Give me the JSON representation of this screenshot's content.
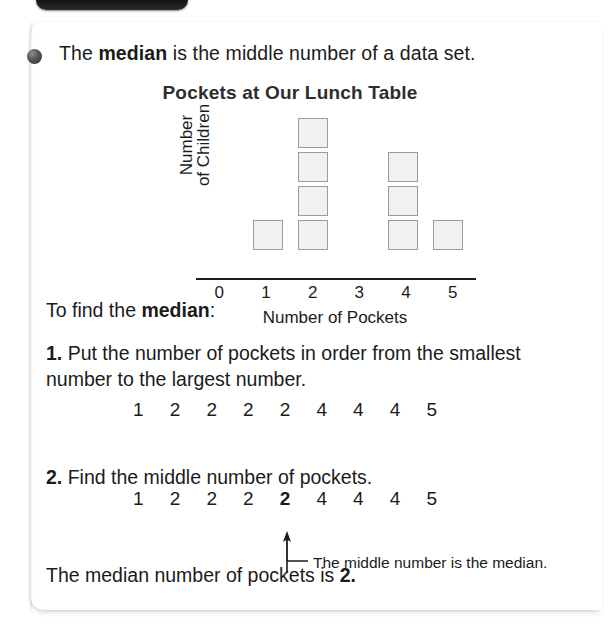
{
  "top_tab": {
    "name": "dark-tab"
  },
  "bullet": {
    "name": "bullet-sphere"
  },
  "intro": {
    "before": "The ",
    "term": "median",
    "after": " is the middle number of a data set."
  },
  "chart_data": {
    "type": "bar",
    "title": "Pockets at Our Lunch Table",
    "xlabel": "Number of Pockets",
    "ylabel_line1": "Number",
    "ylabel_line2": "of Children",
    "categories": [
      "0",
      "1",
      "2",
      "3",
      "4",
      "5"
    ],
    "values": [
      0,
      1,
      4,
      0,
      3,
      1
    ],
    "ylim": [
      0,
      4
    ],
    "grid": false,
    "legend": false,
    "unit": "square-pictograph-box"
  },
  "procedure": {
    "heading_before": "To find the ",
    "heading_term": "median",
    "heading_after": ":",
    "steps": [
      {
        "number": "1.",
        "text": "Put the number of pockets in order from the smallest number to the largest number."
      },
      {
        "number": "2.",
        "text": "Find the middle number of pockets."
      }
    ],
    "sequence_ordered": [
      "1",
      "2",
      "2",
      "2",
      "2",
      "4",
      "4",
      "4",
      "5"
    ],
    "sequence_median": [
      "1",
      "2",
      "2",
      "2",
      "2",
      "4",
      "4",
      "4",
      "5"
    ],
    "median_index": 4
  },
  "callout": {
    "caption": "The middle number is the median.",
    "arrow": "up-arrow-icon"
  },
  "conclusion": {
    "before": "The median number of pockets is ",
    "value": "2",
    "after": "."
  },
  "colors": {
    "text": "#1b1b1b",
    "box_fill": "#f1f1f1",
    "box_border": "#9a9a9a",
    "axis": "#1d1d1d",
    "card": "#ffffff"
  }
}
